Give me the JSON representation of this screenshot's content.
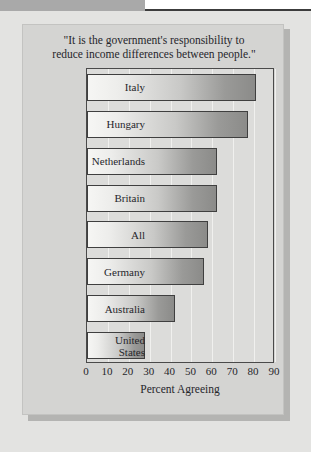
{
  "page": {
    "background_color": "#e3e3e1",
    "top_band_color": "#a9a9a9",
    "panel_color": "#d4d4d2"
  },
  "chart_data": {
    "type": "bar",
    "orientation": "horizontal",
    "title": "\"It is the government's responsibility to reduce income differences between people.\"",
    "title_lines": [
      "\"It is the government's responsibility to",
      "reduce income differences between people.\""
    ],
    "categories": [
      "Italy",
      "Hungary",
      "Netherlands",
      "Britain",
      "All",
      "Germany",
      "Australia",
      "United States"
    ],
    "category_label_lines": [
      [
        "Italy"
      ],
      [
        "Hungary"
      ],
      [
        "Netherlands"
      ],
      [
        "Britain"
      ],
      [
        "All"
      ],
      [
        "Germany"
      ],
      [
        "Australia"
      ],
      [
        "United",
        "States"
      ]
    ],
    "values": [
      81,
      77,
      62,
      62,
      58,
      56,
      42,
      28
    ],
    "xlabel": "Percent Agreeing",
    "ylabel": "",
    "xlim": [
      0,
      90
    ],
    "xticks": [
      0,
      10,
      20,
      30,
      40,
      50,
      60,
      70,
      80,
      90
    ],
    "tick_labels": [
      "0",
      "10",
      "20",
      "30",
      "40",
      "50",
      "60",
      "70",
      "80",
      "90"
    ],
    "grid": true,
    "grid_axis": "x",
    "legend": false,
    "bar_fill_start_color": "#f6f6f4",
    "bar_fill_end_color": "#8b8b89",
    "bar_border_color": "#3f3f3f",
    "plot_background_color": "#dcdcda",
    "text_color": "#26262b"
  }
}
